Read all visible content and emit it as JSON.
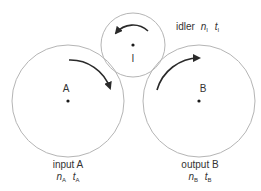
{
  "diagram": {
    "gears": [
      {
        "id": "A",
        "center_label": "A",
        "role_label": "input A",
        "n_symbol": "n",
        "n_sub": "A",
        "t_symbol": "t",
        "t_sub": "A",
        "rotation": "clockwise"
      },
      {
        "id": "I",
        "center_label": "I",
        "role_label": "idler",
        "n_symbol": "n",
        "n_sub": "I",
        "t_symbol": "t",
        "t_sub": "I",
        "rotation": "counterclockwise"
      },
      {
        "id": "B",
        "center_label": "B",
        "role_label": "output B",
        "n_symbol": "n",
        "n_sub": "B",
        "t_symbol": "t",
        "t_sub": "B",
        "rotation": "clockwise"
      }
    ],
    "colors": {
      "circle": "#b5b5b5",
      "arrow": "#2a2a2a",
      "text": "#333333"
    }
  }
}
